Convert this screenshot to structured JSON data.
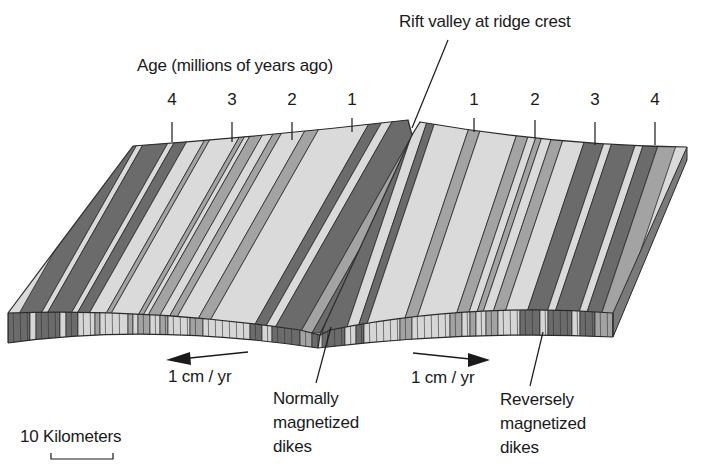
{
  "labels": {
    "rift_valley": "Rift valley at ridge crest",
    "age_axis": "Age (millions of years ago)",
    "rate_left": "1 cm / yr",
    "rate_right": "1 cm / yr",
    "normal_dikes": "Normally\nmagnetized\ndikes",
    "reverse_dikes": "Reversely\nmagnetized\ndikes",
    "scale_bar": "10 Kilometers"
  },
  "age_ticks": {
    "left": [
      "4",
      "3",
      "2",
      "1"
    ],
    "right": [
      "1",
      "2",
      "3",
      "4"
    ]
  },
  "colors": {
    "normal_stripe": "#6b6b6b",
    "medium_stripe": "#a3a3a3",
    "light_stripe": "#dadada",
    "outline": "#2a2a2a",
    "side_face": "#7a7a7a"
  }
}
